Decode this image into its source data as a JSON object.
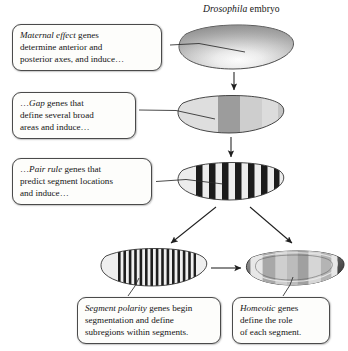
{
  "figure": {
    "title_italic": "Drosophila",
    "title_rest": " embryo"
  },
  "callouts": [
    {
      "id": "maternal-effect",
      "emphasis": "Maternal effect",
      "rest": " genes determine anterior and posterior axes, and induce…",
      "line1_em": "Maternal effect",
      "line1_rest": " genes",
      "line2": "determine anterior and",
      "line3": "posterior axes, and induce…"
    },
    {
      "id": "gap",
      "emphasis": "Gap",
      "rest": " genes that define several broad areas and induce…",
      "line1_pre": "…",
      "line1_em": "Gap",
      "line1_rest": " genes that",
      "line2": "define several broad",
      "line3": "areas and induce…"
    },
    {
      "id": "pair-rule",
      "emphasis": "Pair rule",
      "rest": " genes that predict segment locations and induce…",
      "line1_pre": "…",
      "line1_em": "Pair rule",
      "line1_rest": " genes that",
      "line2": "predict segment locations",
      "line3": "and induce…"
    },
    {
      "id": "segment-polarity",
      "emphasis": "Segment polarity",
      "rest": " genes begin segmentation and define subregions within segments.",
      "line1_em": "Segment polarity",
      "line1_rest": " genes begin",
      "line2": "segmentation and define",
      "line3": "subregions within segments."
    },
    {
      "id": "homeotic",
      "emphasis": "Homeotic",
      "rest": " genes define the role of each segment.",
      "line1_em": "Homeotic",
      "line1_rest": " genes",
      "line2": "define the role",
      "line3": "of each segment."
    }
  ],
  "embryos": [
    {
      "id": "embryo-maternal",
      "stage": "maternal-effect",
      "pattern": "gradient",
      "description": "oval embryo with smooth anterior-posterior gray gradient"
    },
    {
      "id": "embryo-gap",
      "stage": "gap",
      "pattern": "broad-bands",
      "band_count": 4,
      "description": "oval embryo with several broad gray domains"
    },
    {
      "id": "embryo-pair-rule",
      "stage": "pair-rule",
      "pattern": "stripes",
      "stripe_count": 8,
      "description": "oval embryo with seven to eight bold black stripes"
    },
    {
      "id": "embryo-segment-polarity",
      "stage": "segment-polarity",
      "pattern": "fine-stripes",
      "stripe_count": 17,
      "description": "oval embryo with many narrow stripes"
    },
    {
      "id": "embryo-homeotic",
      "stage": "homeotic",
      "pattern": "segmented-shaded",
      "band_count": 5,
      "description": "oval embryo with dark outline ring and shaded segment blocks"
    }
  ],
  "arrows": [
    {
      "id": "arrow-maternal-to-gap",
      "kind": "vertical-down"
    },
    {
      "id": "arrow-gap-to-pair-rule",
      "kind": "vertical-down"
    },
    {
      "id": "arrow-pair-rule-to-segment-polarity",
      "kind": "diagonal-down-left"
    },
    {
      "id": "arrow-pair-rule-to-homeotic",
      "kind": "diagonal-down-right"
    },
    {
      "id": "arrow-segment-polarity-to-homeotic",
      "kind": "horizontal-right"
    }
  ],
  "leaders": [
    {
      "id": "leader-maternal",
      "from": "callout-maternal-effect",
      "to": "embryo-maternal"
    },
    {
      "id": "leader-gap",
      "from": "callout-gap",
      "to": "embryo-gap"
    },
    {
      "id": "leader-pair-rule",
      "from": "callout-pair-rule",
      "to": "embryo-pair-rule"
    },
    {
      "id": "leader-segment-polarity",
      "from": "callout-segment-polarity",
      "to": "embryo-segment-polarity"
    },
    {
      "id": "leader-homeotic",
      "from": "callout-homeotic",
      "to": "embryo-homeotic"
    }
  ],
  "colors": {
    "background": "#ffffff",
    "ink": "#1a1a1a",
    "box_fill": "#fdfdfb",
    "box_border": "#4a4a4a",
    "embryo_outline": "#333333",
    "gray_light": "#e3e3e3",
    "gray_mid": "#b8b8b8",
    "gray_dark": "#8f8f8f",
    "stripe_black": "#1c1c1c"
  }
}
